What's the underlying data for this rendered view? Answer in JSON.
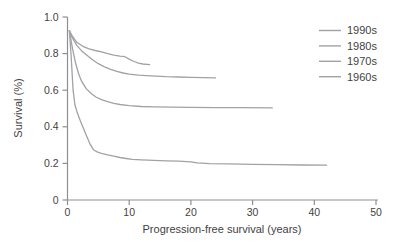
{
  "figure": {
    "background": "#ffffff",
    "axis_color": "#8f8f93",
    "tick_text_color": "#3f3f3f",
    "label_text_color": "#3f3f3f",
    "curve_color": "#a2a2a6"
  },
  "chart_data": {
    "type": "line",
    "title": "",
    "xlabel": "Progression-free survival (years)",
    "ylabel": "Survival (%)",
    "xlim": [
      0,
      50
    ],
    "ylim": [
      0,
      1.0
    ],
    "xticks": {
      "values": [
        0,
        10,
        20,
        30,
        40,
        50
      ],
      "labels": [
        "0",
        "10",
        "20",
        "30",
        "40",
        "50"
      ]
    },
    "yticks": {
      "values": [
        0,
        0.2,
        0.4,
        0.6,
        0.8,
        1.0
      ],
      "labels": [
        "0",
        "0.2",
        "0.4",
        "0.6",
        "0.8",
        "1.0"
      ]
    },
    "grid": false,
    "legend_position": "top-right",
    "legend_entries": [
      "1990s",
      "1980s",
      "1970s",
      "1960s"
    ],
    "series": [
      {
        "name": "1990s",
        "color": "#a2a2a6",
        "points": [
          [
            0.3,
            0.925
          ],
          [
            0.8,
            0.895
          ],
          [
            1.5,
            0.862
          ],
          [
            2.5,
            0.84
          ],
          [
            3.5,
            0.826
          ],
          [
            4.5,
            0.817
          ],
          [
            5.5,
            0.81
          ],
          [
            6.5,
            0.8
          ],
          [
            7.5,
            0.792
          ],
          [
            8.5,
            0.786
          ],
          [
            9.3,
            0.783
          ],
          [
            10.0,
            0.77
          ],
          [
            10.8,
            0.757
          ],
          [
            11.5,
            0.748
          ],
          [
            12.2,
            0.743
          ],
          [
            13.3,
            0.74
          ]
        ]
      },
      {
        "name": "1980s",
        "color": "#a2a2a6",
        "points": [
          [
            0.3,
            0.925
          ],
          [
            0.8,
            0.885
          ],
          [
            1.5,
            0.845
          ],
          [
            2.3,
            0.815
          ],
          [
            3.0,
            0.795
          ],
          [
            4.0,
            0.768
          ],
          [
            5.0,
            0.745
          ],
          [
            6.0,
            0.728
          ],
          [
            7.0,
            0.714
          ],
          [
            8.0,
            0.703
          ],
          [
            9.0,
            0.694
          ],
          [
            10.0,
            0.688
          ],
          [
            11.5,
            0.682
          ],
          [
            13.5,
            0.678
          ],
          [
            16.0,
            0.674
          ],
          [
            18.0,
            0.672
          ],
          [
            20.0,
            0.67
          ],
          [
            22.0,
            0.669
          ],
          [
            24.0,
            0.668
          ]
        ]
      },
      {
        "name": "1970s",
        "color": "#a2a2a6",
        "points": [
          [
            0.3,
            0.925
          ],
          [
            0.8,
            0.83
          ],
          [
            1.3,
            0.75
          ],
          [
            1.8,
            0.69
          ],
          [
            2.3,
            0.648
          ],
          [
            3.0,
            0.61
          ],
          [
            3.8,
            0.583
          ],
          [
            4.6,
            0.563
          ],
          [
            5.5,
            0.548
          ],
          [
            6.5,
            0.537
          ],
          [
            7.5,
            0.528
          ],
          [
            8.5,
            0.522
          ],
          [
            10.0,
            0.516
          ],
          [
            12.0,
            0.511
          ],
          [
            14.0,
            0.509
          ],
          [
            17.0,
            0.507
          ],
          [
            20.0,
            0.506
          ],
          [
            24.0,
            0.505
          ],
          [
            28.0,
            0.505
          ],
          [
            33.2,
            0.504
          ]
        ]
      },
      {
        "name": "1960s",
        "color": "#a2a2a6",
        "points": [
          [
            0.3,
            0.925
          ],
          [
            0.6,
            0.78
          ],
          [
            0.9,
            0.6
          ],
          [
            1.2,
            0.52
          ],
          [
            1.6,
            0.475
          ],
          [
            2.1,
            0.43
          ],
          [
            2.6,
            0.39
          ],
          [
            3.1,
            0.35
          ],
          [
            3.6,
            0.31
          ],
          [
            4.2,
            0.275
          ],
          [
            4.8,
            0.263
          ],
          [
            5.5,
            0.255
          ],
          [
            6.5,
            0.247
          ],
          [
            7.5,
            0.24
          ],
          [
            8.5,
            0.232
          ],
          [
            9.5,
            0.227
          ],
          [
            10.5,
            0.222
          ],
          [
            12.0,
            0.219
          ],
          [
            14.0,
            0.217
          ],
          [
            16.0,
            0.214
          ],
          [
            18.0,
            0.212
          ],
          [
            20.0,
            0.209
          ],
          [
            21.0,
            0.203
          ],
          [
            23.0,
            0.199
          ],
          [
            26.0,
            0.197
          ],
          [
            30.0,
            0.195
          ],
          [
            34.0,
            0.193
          ],
          [
            38.0,
            0.191
          ],
          [
            42.0,
            0.19
          ]
        ]
      }
    ]
  }
}
